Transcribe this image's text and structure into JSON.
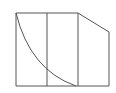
{
  "diagram": {
    "width": 116,
    "height": 93,
    "stroke_color": "#555555",
    "background": "#ffffff",
    "shape": {
      "outline_points": "16,13 78,13 109,32 109,86 16,86",
      "dividers": [
        {
          "x1": 47,
          "y1": 13,
          "x2": 47,
          "y2": 86
        },
        {
          "x1": 78,
          "y1": 13,
          "x2": 78,
          "y2": 86
        }
      ],
      "curve_path": "M16,13 Q30,70 76,86"
    }
  }
}
